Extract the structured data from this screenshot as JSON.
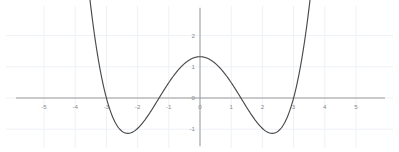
{
  "chart_data": {
    "type": "line",
    "title": "",
    "subtitle": "",
    "xlabel": "",
    "ylabel": "",
    "xlim": [
      -5.9,
      5.9
    ],
    "ylim": [
      -1.75,
      2.55
    ],
    "grid": true,
    "grid_color": "#eef1f5",
    "axis_color": "#9a9a9a",
    "curve_color": "#4a4a4a",
    "background": "#ffffff",
    "legend": null,
    "legend_position": "none",
    "x_ticks": [
      -5,
      -4,
      -3,
      -2,
      -1,
      0,
      1,
      2,
      3,
      4,
      5
    ],
    "x_tick_labels": [
      "-5",
      "-4",
      "-3",
      "-2",
      "-1",
      "0",
      "1",
      "2",
      "3",
      "4",
      "5"
    ],
    "y_ticks": [
      -1,
      0,
      1,
      2
    ],
    "y_tick_labels": [
      "-1",
      "0",
      "1",
      "2"
    ],
    "series": [
      {
        "name": "quartic",
        "expression": "y = 0.0855 * (x^2 - 1.72) * (x^2 - 9)",
        "roots": [
          -3.0,
          -1.31,
          1.31,
          3.0
        ],
        "local_maximum": {
          "x": 0.0,
          "y": 0.7
        },
        "local_minima": [
          {
            "x": -2.32,
            "y": -1.32
          },
          {
            "x": 2.32,
            "y": -1.32
          }
        ],
        "x": [
          -3.55,
          -3.4,
          -3.2,
          -3.0,
          -2.8,
          -2.6,
          -2.4,
          -2.2,
          -2.0,
          -1.8,
          -1.6,
          -1.4,
          -1.2,
          -1.0,
          -0.8,
          -0.6,
          -0.4,
          -0.2,
          0.0,
          0.2,
          0.4,
          0.6,
          0.8,
          1.0,
          1.2,
          1.4,
          1.6,
          1.8,
          2.0,
          2.2,
          2.4,
          2.6,
          2.8,
          3.0,
          3.2,
          3.4,
          3.55
        ],
        "y": [
          2.61,
          1.83,
          1.0,
          0.0,
          -0.72,
          -1.12,
          -1.3,
          -1.33,
          -1.25,
          -1.09,
          -0.88,
          -0.63,
          -0.37,
          -0.13,
          0.09,
          0.28,
          0.46,
          0.62,
          0.7,
          0.62,
          0.46,
          0.28,
          0.09,
          -0.13,
          -0.37,
          -0.63,
          -0.88,
          -1.09,
          -1.25,
          -1.33,
          -1.3,
          -1.12,
          -0.72,
          0.0,
          1.0,
          1.83,
          2.61
        ]
      }
    ]
  },
  "geometry": {
    "origin_x_px": 200,
    "origin_y_px": 98,
    "px_per_unit_x": 31.2,
    "px_per_unit_y": 31.2,
    "x_axis_left_px": 16,
    "x_axis_right_px": 385,
    "y_axis_top_px": 8,
    "y_axis_bottom_px": 146
  }
}
